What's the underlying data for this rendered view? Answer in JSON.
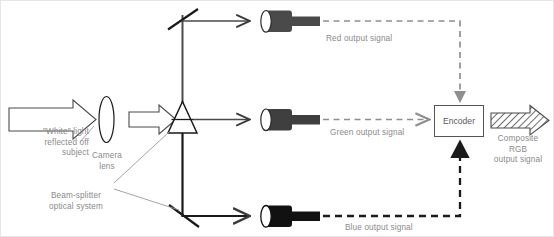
{
  "diagram": {
    "title_present": false,
    "labels": {
      "white_light": "\"White\" light\nreflected off\nsubject",
      "camera_lens": "Camera\nlens",
      "beam_splitter": "Beam-splitter\noptical system",
      "red_output": "Red output signal",
      "green_output": "Green output signal",
      "blue_output": "Blue output signal",
      "encoder": "Encoder",
      "composite": "Composite\nRGB\noutput signal"
    },
    "components": {
      "input_arrow": "white-light-arrow",
      "lens": "camera-lens-ellipse",
      "lens_arrow": "lens-to-prism-arrow",
      "prism": "beam-splitter-prism",
      "mirror_top": "top-mirror",
      "mirror_bottom": "bottom-mirror",
      "sensor_red": "red-sensor-tube",
      "sensor_green": "green-sensor-tube",
      "sensor_blue": "blue-sensor-tube",
      "encoder_block": "encoder-block",
      "composite_arrow": "composite-rgb-arrow"
    },
    "colors": {
      "line": "#1a1a1a",
      "beam_line": "#4a4a4a",
      "sensor_red": "#4a4a4a",
      "sensor_green": "#3f3f3f",
      "sensor_blue": "#111111",
      "dash_red": "#8f8f8f",
      "dash_green": "#8f8f8f",
      "dash_blue": "#1a1a1a",
      "text": "#8a8a8a",
      "outline": "#555555",
      "background": "#ffffff"
    },
    "signal_paths": [
      {
        "name": "red",
        "from": "red-sensor-tube",
        "to": "encoder-top",
        "style": "dashed-thin-gray"
      },
      {
        "name": "green",
        "from": "green-sensor-tube",
        "to": "encoder-left",
        "style": "dashed-thin-gray"
      },
      {
        "name": "blue",
        "from": "blue-sensor-tube",
        "to": "encoder-bottom",
        "style": "dashed-thick-black"
      }
    ]
  }
}
